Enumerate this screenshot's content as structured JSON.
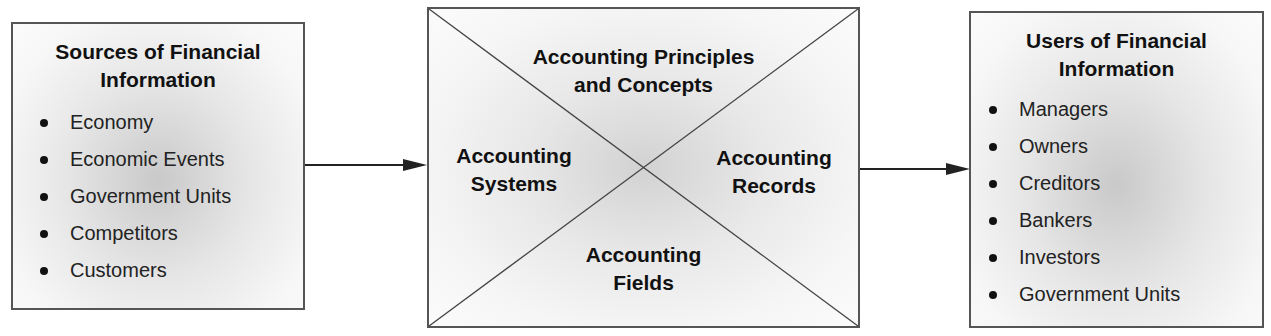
{
  "diagram": {
    "sources": {
      "title": "Sources of Financial Information",
      "title_line1": "Sources of Financial",
      "title_line2": "Information",
      "items": [
        "Economy",
        "Economic Events",
        "Government Units",
        "Competitors",
        "Customers"
      ]
    },
    "accounting": {
      "top": {
        "line1": "Accounting Principles",
        "line2": "and Concepts"
      },
      "left": {
        "line1": "Accounting",
        "line2": "Systems"
      },
      "right": {
        "line1": "Accounting",
        "line2": "Records"
      },
      "bottom": {
        "line1": "Accounting",
        "line2": "Fields"
      }
    },
    "users": {
      "title": "Users of Financial Information",
      "title_line1": "Users of Financial",
      "title_line2": "Information",
      "items": [
        "Managers",
        "Owners",
        "Creditors",
        "Bankers",
        "Investors",
        "Government Units"
      ]
    },
    "flows": [
      {
        "from": "Sources of Financial Information",
        "to": "Accounting"
      },
      {
        "from": "Accounting",
        "to": "Users of Financial Information"
      }
    ],
    "colors": {
      "border": "#555555",
      "text": "#111111",
      "shade": "#c9c9c9"
    }
  }
}
